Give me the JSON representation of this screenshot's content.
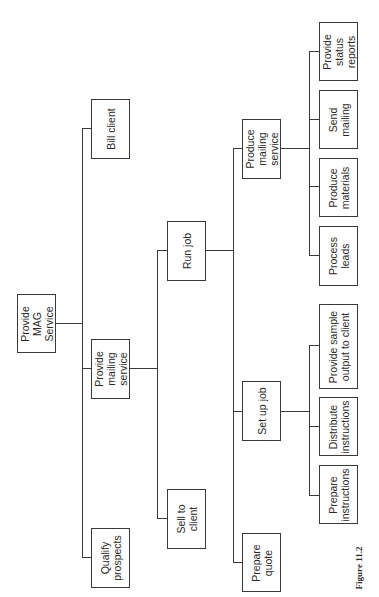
{
  "diagram": {
    "type": "hierarchy-chart",
    "orientation": "rotated-90-ccw",
    "caption": "Figure 11.2",
    "nodes": {
      "root": "Provide\nMAG\nService",
      "qualify_prospects": "Qualify\nprospects",
      "provide_mailing_service": "Provide\nmailing\nservice",
      "bill_client": "Bill client",
      "sell_to_client": "Sell to\nclient",
      "run_job": "Run job",
      "prepare_quote": "Prepare\nquote",
      "set_up_job": "Set up job",
      "produce_mailing_service": "Produce\nmailing\nservice",
      "prepare_instructions": "Prepare\ninstructions",
      "distribute_instructions": "Distribute\ninstructions",
      "provide_sample_output": "Provide sample\noutput to client",
      "process_leads": "Process\nleads",
      "produce_materials": "Produce\nmaterials",
      "send_mailing": "Send\nmailing",
      "provide_status_reports": "Provide\nstatus\nreports"
    },
    "tree": {
      "Provide MAG Service": [
        "Qualify prospects",
        "Provide mailing service",
        "Bill client"
      ],
      "Provide mailing service": [
        "Sell to client",
        "Run job"
      ],
      "Run job": [
        "Prepare quote",
        "Set up job",
        "Produce mailing service"
      ],
      "Set up job": [
        "Prepare instructions",
        "Distribute instructions",
        "Provide sample output to client"
      ],
      "Produce mailing service": [
        "Process leads",
        "Produce materials",
        "Send mailing",
        "Provide status reports"
      ]
    },
    "colors": {
      "line": "#3a3a3a",
      "text": "#2a2a2a",
      "background": "#ffffff"
    }
  }
}
